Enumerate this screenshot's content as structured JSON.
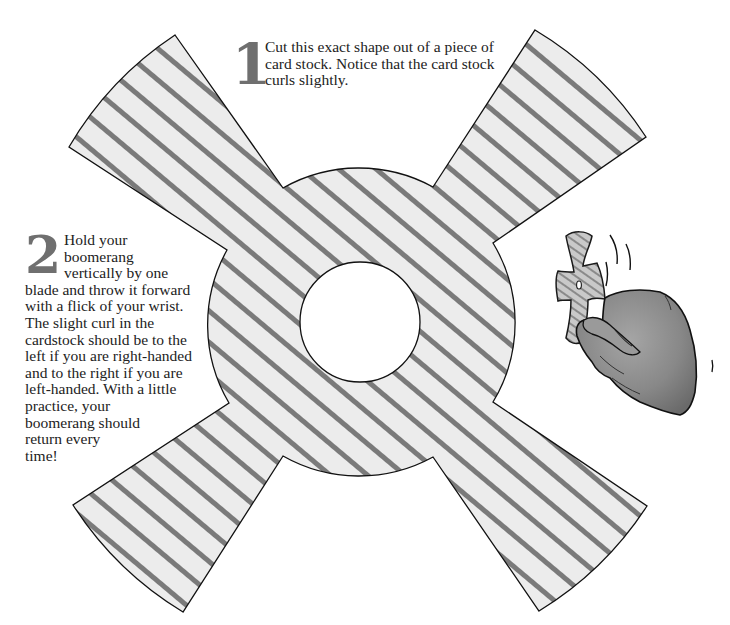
{
  "illustration": {
    "title": "Paper boomerang cut-out template",
    "colors": {
      "fill": "#ececec",
      "stripe": "#7a7a7a",
      "outline": "#111111",
      "hand": "#8c8c8c",
      "step_number": "#6f6f6f"
    }
  },
  "steps": [
    {
      "number": "1",
      "text": "Cut this exact shape out of a piece of card stock. Notice that the card stock curls slightly."
    },
    {
      "number": "2",
      "lines": [
        "Hold your",
        "boomerang",
        "vertically by one",
        "blade and throw it forward",
        "with a flick of your wrist.",
        "The slight curl in the",
        "cardstock should be to the",
        "left if you are right-handed",
        "and to the right if you are",
        "left-handed. With a little",
        "practice, your",
        "boomerang should",
        "return every",
        "time!"
      ]
    }
  ]
}
